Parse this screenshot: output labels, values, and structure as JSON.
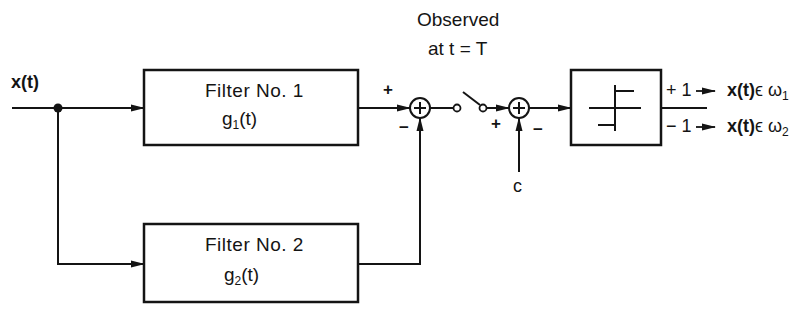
{
  "diagram": {
    "type": "block-diagram",
    "input": {
      "label": "x(t)"
    },
    "filters": [
      {
        "id": "filter-1",
        "title": "Filter No. 1",
        "func_base": "g",
        "func_sub": "1",
        "func_arg": "(t)"
      },
      {
        "id": "filter-2",
        "title": "Filter No. 2",
        "func_base": "g",
        "func_sub": "2",
        "func_arg": "(t)"
      }
    ],
    "summer_1": {
      "plus_sign": "+",
      "minus_sign": "−"
    },
    "sampler": {
      "line1": "Observed",
      "line2": "at  t = T"
    },
    "summer_2": {
      "plus_sign": "+",
      "minus_sign": "−",
      "threshold_label": "c"
    },
    "decision": {
      "symbol": "sign/threshold nonlinearity"
    },
    "outputs": [
      {
        "value": "+ 1",
        "arrow": "→",
        "base": "x(t)",
        "set": "ϵ ω",
        "sub": "1"
      },
      {
        "value": "− 1",
        "arrow": "→",
        "base": "x(t)",
        "set": "ϵ ω",
        "sub": "2"
      }
    ],
    "stroke_color": "#141414",
    "background": "#ffffff"
  }
}
